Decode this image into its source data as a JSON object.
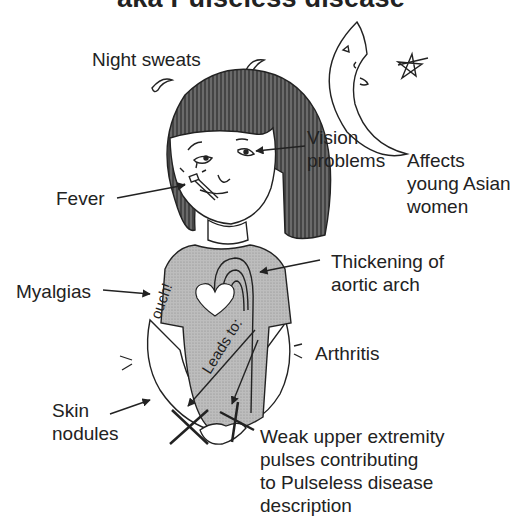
{
  "title": "aka Pulseless disease",
  "labels": {
    "night_sweats": "Night sweats",
    "vision": [
      "Vision",
      "problems"
    ],
    "affects": [
      "Affects",
      "young Asian",
      "women"
    ],
    "fever": "Fever",
    "thickening": [
      "Thickening of",
      "aortic arch"
    ],
    "myalgias": "Myalgias",
    "arthritis": "Arthritis",
    "skin_nodules": [
      "Skin",
      "nodules"
    ],
    "weak_pulses": [
      "Weak upper extremity",
      "pulses contributing",
      "to Pulseless disease",
      "description"
    ]
  },
  "shirt_text": {
    "ouch": "ouch!",
    "leads_to": "Leads to:"
  },
  "colors": {
    "ink": "#222222",
    "hair": "#555555",
    "shirt": "#b8b8b8",
    "shirt_dark": "#9a9a9a",
    "background": "#ffffff"
  }
}
